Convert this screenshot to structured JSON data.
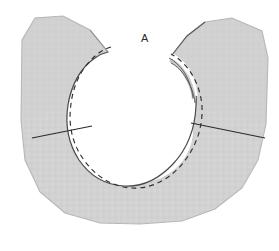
{
  "figure": {
    "kind": "sewing-pattern-piece",
    "title": "A",
    "background_color": "#ffffff",
    "fabric_fill": "#d2d2d2",
    "fabric_fill_shade": "#c9c9c9",
    "outline_color": "#3a3a3a",
    "soft_outline_color": "#b7b7b7",
    "dashed_line_color": "#2f2f2f",
    "seam_line_color": "#2b2b2b",
    "label_color": "#2b2b2b"
  },
  "labels": {
    "piece_a": {
      "text": "A",
      "x": 141,
      "y": 33,
      "font_size": 11
    }
  },
  "geometry": {
    "canvas": {
      "width": 279,
      "height": 251
    },
    "neck_hole": {
      "center_x": 140,
      "center_y": 129,
      "radius_x": 53,
      "radius_y": 53
    },
    "stitch_circle": {
      "center_x": 140,
      "center_y": 129,
      "radius_x": 62,
      "radius_y": 62,
      "dash": "5 4"
    },
    "outer_body": {
      "left_x": 21,
      "right_x": 268,
      "top_y": 14,
      "bottom_y": 224
    },
    "shoulder_gap": {
      "left_tip_x": 108,
      "left_tip_y": 52,
      "right_tip_x": 172,
      "right_tip_y": 55
    },
    "seam_line_left": {
      "x1": 32,
      "y1": 138,
      "x2": 90,
      "y2": 126
    },
    "seam_line_right": {
      "x1": 191,
      "y1": 123,
      "x2": 265,
      "y2": 138
    },
    "facing_strip": {
      "present": true,
      "side": "right-shoulder",
      "gap_color": "#ffffff"
    }
  },
  "elements": {
    "fabric_body_name": "fabric-body",
    "neck_opening_name": "neck-opening",
    "stitch_line_name": "neckline-stitch-dashed",
    "facing_name": "right-shoulder-facing",
    "seam_left_name": "left-shoulder-seam-line",
    "seam_right_name": "right-shoulder-seam-line"
  }
}
